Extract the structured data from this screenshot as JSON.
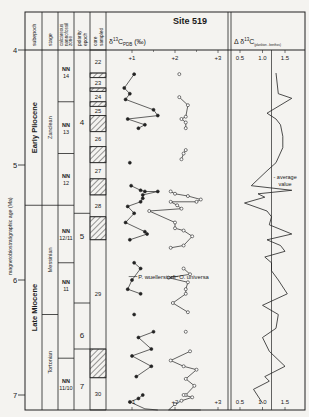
{
  "chart_data": {
    "type": "line",
    "title": "Site 519",
    "ylabel": "magnetobiostratigraphic age (Ma)",
    "ylim": [
      4,
      7.13
    ],
    "y_ticks": [
      "4",
      "5",
      "6",
      "7"
    ],
    "header_columns": [
      "subepoch",
      "stage",
      "calcareous nannofossil zone",
      "polarity epoch",
      "core sampled"
    ],
    "subepochs": [
      {
        "label": "Early Pliocene",
        "from": 4.0,
        "to": 5.35
      },
      {
        "label": "Late Miocene",
        "from": 5.35,
        "to": 7.13
      }
    ],
    "stages": [
      {
        "label": "Zanclean",
        "from": 4.0,
        "to": 5.35
      },
      {
        "label": "Messinian",
        "from": 5.35,
        "to": 6.3
      },
      {
        "label": "Tortonian",
        "from": 6.3,
        "to": 7.13
      }
    ],
    "nannofossil_zones": [
      {
        "label": "NN 14",
        "from": 4.0,
        "to": 4.45
      },
      {
        "label": "NN 13",
        "from": 4.45,
        "to": 4.9
      },
      {
        "label": "NN 12",
        "from": 4.9,
        "to": 5.35
      },
      {
        "label": "NN 12/11",
        "from": 5.35,
        "to": 5.85
      },
      {
        "label": "NN 11",
        "from": 5.85,
        "to": 6.68
      },
      {
        "label": "NN 11/10",
        "from": 6.68,
        "to": 7.13
      }
    ],
    "polarity_epochs": [
      {
        "label": "4",
        "from": 4.0,
        "to": 5.42
      },
      {
        "label": "5",
        "from": 5.42,
        "to": 6.2
      },
      {
        "label": "6",
        "from": 6.2,
        "to": 6.6
      },
      {
        "label": "7",
        "from": 6.6,
        "to": 7.13
      }
    ],
    "cores": [
      {
        "label": "22",
        "from": 4.0,
        "to": 4.2,
        "gap_after": 0.04
      },
      {
        "label": "23",
        "from": 4.24,
        "to": 4.33,
        "gap_after": 0.03
      },
      {
        "label": "24",
        "from": 4.36,
        "to": 4.45,
        "gap_after": 0.04
      },
      {
        "label": "25",
        "from": 4.49,
        "to": 4.57,
        "gap_after": 0.14
      },
      {
        "label": "26",
        "from": 4.71,
        "to": 4.84,
        "gap_after": 0.14
      },
      {
        "label": "27",
        "from": 4.98,
        "to": 5.12,
        "gap_after": 0.14
      },
      {
        "label": "28",
        "from": 5.26,
        "to": 5.45,
        "gap_after": 0.2
      },
      {
        "label": "29",
        "from": 5.65,
        "to": 6.6,
        "gap_after": 0.25
      },
      {
        "label": "30",
        "from": 6.85,
        "to": 7.13,
        "gap_after": 0
      }
    ],
    "panels": [
      {
        "title": "δ13C PDB (‰)",
        "x_ticks": [
          "+1",
          "+2",
          "+3"
        ],
        "xlim": [
          0.4,
          3.2
        ],
        "series": [
          {
            "name": "P. wuellerstorfi",
            "marker": "filled-circle",
            "points": [
              [
                1.05,
                4.21
              ],
              [
                0.82,
                4.33
              ],
              [
                0.95,
                4.38
              ],
              [
                0.85,
                4.43
              ],
              [
                1.5,
                4.52
              ],
              [
                1.6,
                4.57
              ],
              [
                0.9,
                4.6
              ],
              [
                1.3,
                4.65
              ],
              [
                1.15,
                4.68
              ],
              [
                0.95,
                4.98
              ],
              [
                0.98,
                5.18
              ],
              [
                1.2,
                5.22
              ],
              [
                1.3,
                5.23
              ],
              [
                1.6,
                5.23
              ],
              [
                1.25,
                5.26
              ],
              [
                1.25,
                5.29
              ],
              [
                1.2,
                5.32
              ],
              [
                0.9,
                5.36
              ],
              [
                1.05,
                5.42
              ],
              [
                0.85,
                5.5
              ],
              [
                1.3,
                5.58
              ],
              [
                1.35,
                5.6
              ],
              [
                0.95,
                5.65
              ],
              [
                1.05,
                5.85
              ],
              [
                1.2,
                5.9
              ],
              [
                1.0,
                6.0
              ],
              [
                0.9,
                6.08
              ],
              [
                1.2,
                6.12
              ],
              [
                1.05,
                6.3
              ],
              [
                1.5,
                6.45
              ],
              [
                1.15,
                6.5
              ],
              [
                1.45,
                6.6
              ],
              [
                1.0,
                6.66
              ],
              [
                1.45,
                6.75
              ],
              [
                1.1,
                6.84
              ],
              [
                1.25,
                7.0
              ],
              [
                1.15,
                7.03
              ],
              [
                0.95,
                7.06
              ],
              [
                1.3,
                7.12
              ],
              [
                1.6,
                7.2
              ]
            ]
          },
          {
            "name": "O. universa",
            "marker": "open-circle",
            "points": [
              [
                2.1,
                4.21
              ],
              [
                2.1,
                4.41
              ],
              [
                2.3,
                4.48
              ],
              [
                2.25,
                4.58
              ],
              [
                2.15,
                4.6
              ],
              [
                2.25,
                4.63
              ],
              [
                2.25,
                4.68
              ],
              [
                2.25,
                4.87
              ],
              [
                2.2,
                4.9
              ],
              [
                2.15,
                4.95
              ],
              [
                1.9,
                5.23
              ],
              [
                2.0,
                5.25
              ],
              [
                2.3,
                5.27
              ],
              [
                2.6,
                5.3
              ],
              [
                2.5,
                5.32
              ],
              [
                1.9,
                5.32
              ],
              [
                2.05,
                5.35
              ],
              [
                2.15,
                5.38
              ],
              [
                1.4,
                5.4
              ],
              [
                2.0,
                5.5
              ],
              [
                2.0,
                5.55
              ],
              [
                2.2,
                5.57
              ],
              [
                2.4,
                5.62
              ],
              [
                2.2,
                5.7
              ],
              [
                1.9,
                5.72
              ],
              [
                2.2,
                5.9
              ],
              [
                2.35,
                5.95
              ],
              [
                1.85,
                5.98
              ],
              [
                2.3,
                6.02
              ],
              [
                2.25,
                6.08
              ],
              [
                2.25,
                6.12
              ],
              [
                1.95,
                6.2
              ],
              [
                2.3,
                6.28
              ],
              [
                2.25,
                6.45
              ],
              [
                2.35,
                6.62
              ],
              [
                1.9,
                6.7
              ],
              [
                2.2,
                6.75
              ],
              [
                2.5,
                6.78
              ],
              [
                2.25,
                6.86
              ],
              [
                2.45,
                6.92
              ],
              [
                2.25,
                7.0
              ],
              [
                2.2,
                7.0
              ],
              [
                2.4,
                7.02
              ],
              [
                2.15,
                7.05
              ],
              [
                2.0,
                7.08
              ],
              [
                1.85,
                7.13
              ],
              [
                2.6,
                7.2
              ]
            ]
          }
        ],
        "annotations": [
          "P. wuellerstorfi",
          "O. universa"
        ]
      },
      {
        "title": "Δ δ13C (plankton - benthos)",
        "x_ticks": [
          "0.5",
          "1.0",
          "1.5"
        ],
        "xlim": [
          0.3,
          1.95
        ],
        "reference_line": {
          "value": 1.2,
          "label": "average value"
        },
        "series": [
          {
            "name": "Δ δ13C",
            "points": [
              [
                1.3,
                4.2
              ],
              [
                1.35,
                4.38
              ],
              [
                1.65,
                4.42
              ],
              [
                1.1,
                4.55
              ],
              [
                1.3,
                4.6
              ],
              [
                1.4,
                4.65
              ],
              [
                1.45,
                4.75
              ],
              [
                1.45,
                4.85
              ],
              [
                1.3,
                4.98
              ],
              [
                1.1,
                5.05
              ],
              [
                0.75,
                5.18
              ],
              [
                1.65,
                5.22
              ],
              [
                0.9,
                5.25
              ],
              [
                1.05,
                5.28
              ],
              [
                0.6,
                5.33
              ],
              [
                1.1,
                5.4
              ],
              [
                1.2,
                5.45
              ],
              [
                1.15,
                5.52
              ],
              [
                1.65,
                5.6
              ],
              [
                1.1,
                5.65
              ],
              [
                1.4,
                5.7
              ],
              [
                1.5,
                5.75
              ],
              [
                1.05,
                5.8
              ],
              [
                1.2,
                5.85
              ],
              [
                1.2,
                5.92
              ],
              [
                1.35,
                6.0
              ],
              [
                1.55,
                6.12
              ],
              [
                1.0,
                6.22
              ],
              [
                1.35,
                6.3
              ],
              [
                1.3,
                6.42
              ],
              [
                1.0,
                6.5
              ],
              [
                1.15,
                6.62
              ],
              [
                1.5,
                6.75
              ],
              [
                1.05,
                6.84
              ],
              [
                1.15,
                6.88
              ],
              [
                0.8,
                6.95
              ],
              [
                1.0,
                7.07
              ]
            ]
          }
        ]
      }
    ]
  }
}
